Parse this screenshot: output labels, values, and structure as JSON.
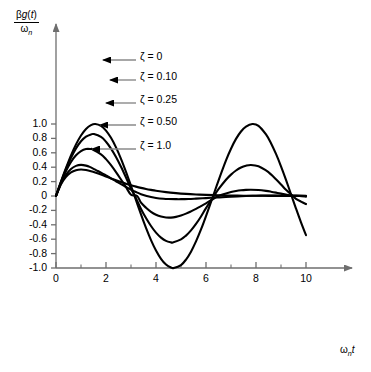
{
  "chart_data": {
    "type": "line",
    "title": "",
    "subtitle": "",
    "xlabel": "ωₙt",
    "ylabel": "βg(t)/ωₙ",
    "ylabel_numerator": "βg(t)",
    "ylabel_denominator": "ωₙ",
    "xlim": [
      0,
      10
    ],
    "ylim": [
      -1.0,
      1.0
    ],
    "grid": false,
    "legend_position": "inside-upper-right",
    "x_ticks_major": [
      0,
      2,
      4,
      6,
      8,
      10
    ],
    "x_tick_labels": [
      "0",
      "2",
      "4",
      "6",
      "8",
      "10"
    ],
    "x_ticks_minor": [
      1,
      3,
      5,
      7,
      9
    ],
    "y_ticks_major": [
      1.0,
      0.8,
      0.6,
      0.4,
      0.2,
      0,
      -0.2,
      -0.4,
      -0.6,
      -0.8,
      -1.0
    ],
    "y_tick_labels": [
      "1.0",
      "0.8",
      "0.6",
      "0.4",
      "0.2",
      "0",
      "-0.2",
      "-0.4",
      "-0.6",
      "-0.8",
      "-1.0"
    ],
    "line_color": "#000000",
    "leader_color": "#8a8a8a",
    "axis_color": "#6e6e6e",
    "series": [
      {
        "name": "ζ = 0",
        "zeta": 0,
        "legend_label": "ζ = 0",
        "peak1": 1.0,
        "peak1_x": 1.57,
        "trough1": -1.0,
        "trough1_x": 4.71,
        "peak2": 0.98,
        "peak2_x": 7.85,
        "end_value": -0.2,
        "x": [
          0,
          0.2,
          0.4,
          0.6,
          0.8,
          1.0,
          1.2,
          1.4,
          1.571,
          1.8,
          2.0,
          2.2,
          2.4,
          2.6,
          2.8,
          3.0,
          3.1416,
          3.4,
          3.6,
          3.8,
          4.0,
          4.2,
          4.4,
          4.6,
          4.712,
          5.0,
          5.2,
          5.4,
          5.6,
          5.8,
          6.0,
          6.2832,
          6.5,
          6.8,
          7.0,
          7.2,
          7.4,
          7.6,
          7.854,
          8.1,
          8.4,
          8.6,
          8.8,
          9.0,
          9.2,
          9.4248,
          9.6,
          9.8,
          10.0
        ],
        "y": [
          0,
          0.199,
          0.389,
          0.565,
          0.717,
          0.841,
          0.932,
          0.985,
          1.0,
          0.974,
          0.909,
          0.808,
          0.675,
          0.516,
          0.335,
          0.141,
          0.0,
          -0.256,
          -0.443,
          -0.612,
          -0.757,
          -0.872,
          -0.952,
          -0.994,
          -1.0,
          -0.959,
          -0.883,
          -0.773,
          -0.631,
          -0.465,
          -0.279,
          0.0,
          0.215,
          0.495,
          0.657,
          0.793,
          0.896,
          0.964,
          1.0,
          0.975,
          0.855,
          0.734,
          0.584,
          0.412,
          0.224,
          0.0,
          -0.174,
          -0.366,
          -0.544
        ]
      },
      {
        "name": "ζ = 0.10",
        "zeta": 0.1,
        "legend_label": "ζ = 0.10",
        "peak1": 0.88,
        "peak1_x": 1.52,
        "trough1": -0.65,
        "trough1_x": 4.67,
        "peak2": 0.44,
        "peak2_x": 7.8,
        "end_value": -0.08,
        "x": [
          0,
          0.2,
          0.4,
          0.6,
          0.8,
          1.0,
          1.2,
          1.4,
          1.52,
          1.8,
          2.0,
          2.2,
          2.4,
          2.6,
          2.8,
          3.0,
          3.157,
          3.4,
          3.6,
          3.8,
          4.0,
          4.2,
          4.4,
          4.6,
          4.67,
          5.0,
          5.2,
          5.4,
          5.6,
          5.8,
          6.0,
          6.315,
          6.5,
          6.8,
          7.0,
          7.2,
          7.4,
          7.6,
          7.8,
          8.1,
          8.4,
          8.6,
          8.8,
          9.0,
          9.2,
          9.472,
          9.6,
          9.8,
          10.0
        ],
        "y": [
          0,
          0.195,
          0.373,
          0.531,
          0.661,
          0.76,
          0.824,
          0.855,
          0.86,
          0.82,
          0.753,
          0.659,
          0.542,
          0.406,
          0.257,
          0.101,
          0.0,
          -0.18,
          -0.306,
          -0.417,
          -0.509,
          -0.578,
          -0.623,
          -0.644,
          -0.645,
          -0.602,
          -0.55,
          -0.478,
          -0.388,
          -0.284,
          -0.169,
          0.0,
          0.095,
          0.226,
          0.297,
          0.354,
          0.396,
          0.421,
          0.431,
          0.414,
          0.355,
          0.3,
          0.233,
          0.161,
          0.086,
          0.0,
          -0.039,
          -0.078,
          -0.112
        ]
      },
      {
        "name": "ζ = 0.25",
        "zeta": 0.25,
        "legend_label": "ζ = 0.25",
        "peak1": 0.72,
        "peak1_x": 1.45,
        "trough1": -0.33,
        "trough1_x": 4.6,
        "peak2": 0.1,
        "peak2_x": 7.7,
        "end_value": -0.02,
        "x": [
          0,
          0.2,
          0.4,
          0.6,
          0.8,
          1.0,
          1.2,
          1.4,
          1.45,
          1.8,
          2.0,
          2.2,
          2.4,
          2.6,
          2.8,
          3.0,
          3.245,
          3.4,
          3.6,
          3.8,
          4.0,
          4.2,
          4.4,
          4.6,
          4.8,
          5.0,
          5.2,
          5.4,
          5.6,
          5.8,
          6.0,
          6.489,
          6.8,
          7.0,
          7.2,
          7.4,
          7.6,
          7.8,
          8.1,
          8.4,
          8.6,
          8.8,
          9.0,
          9.4,
          9.734,
          10.0
        ],
        "y": [
          0,
          0.189,
          0.347,
          0.473,
          0.565,
          0.624,
          0.652,
          0.652,
          0.65,
          0.579,
          0.512,
          0.428,
          0.332,
          0.229,
          0.123,
          0.018,
          0.0,
          -0.093,
          -0.163,
          -0.219,
          -0.26,
          -0.286,
          -0.299,
          -0.3,
          -0.29,
          -0.271,
          -0.245,
          -0.213,
          -0.178,
          -0.14,
          -0.102,
          0.0,
          0.036,
          0.055,
          0.069,
          0.079,
          0.085,
          0.087,
          0.083,
          0.071,
          0.06,
          0.047,
          0.033,
          0.006,
          0.0,
          -0.009
        ]
      },
      {
        "name": "ζ = 0.50",
        "zeta": 0.5,
        "legend_label": "ζ = 0.50",
        "peak1": 0.57,
        "peak1_x": 1.35,
        "trough1": -0.13,
        "trough1_x": 4.5,
        "peak2": 0.03,
        "peak2_x": 7.5,
        "end_value": -0.005,
        "x": [
          0,
          0.2,
          0.4,
          0.6,
          0.8,
          1.0,
          1.2,
          1.35,
          1.6,
          1.8,
          2.0,
          2.2,
          2.4,
          2.6,
          2.8,
          3.0,
          3.2,
          3.4,
          3.628,
          3.8,
          4.0,
          4.3,
          4.5,
          4.8,
          5.0,
          5.3,
          5.6,
          6.0,
          6.4,
          6.8,
          7.255,
          7.6,
          8.0,
          8.4,
          8.8,
          9.2,
          9.6,
          10.0
        ],
        "y": [
          0,
          0.172,
          0.295,
          0.375,
          0.418,
          0.432,
          0.422,
          0.404,
          0.36,
          0.325,
          0.286,
          0.246,
          0.205,
          0.164,
          0.125,
          0.088,
          0.055,
          0.025,
          0.0,
          -0.015,
          -0.027,
          -0.038,
          -0.042,
          -0.044,
          -0.044,
          -0.041,
          -0.036,
          -0.029,
          -0.021,
          -0.014,
          -0.005,
          0.0,
          0.004,
          0.006,
          0.007,
          0.006,
          0.005,
          0.004
        ]
      },
      {
        "name": "ζ = 1.0",
        "zeta": 1.0,
        "legend_label": "ζ = 1.0",
        "peak1": 0.37,
        "peak1_x": 1.0,
        "trough1": -0.03,
        "trough1_x": 4.5,
        "peak2": 0.0,
        "peak2_x": 0,
        "end_value": 0.0,
        "x": [
          0,
          0.2,
          0.4,
          0.6,
          0.8,
          1.0,
          1.2,
          1.4,
          1.6,
          1.8,
          2.0,
          2.2,
          2.4,
          2.6,
          2.8,
          3.0,
          3.2,
          3.4,
          3.6,
          3.8,
          4.0,
          4.4,
          4.8,
          5.2,
          5.6,
          6.0,
          6.5,
          7.0,
          7.5,
          8.0,
          8.5,
          9.0,
          9.5,
          10.0
        ],
        "y": [
          0,
          0.164,
          0.268,
          0.329,
          0.359,
          0.368,
          0.361,
          0.345,
          0.323,
          0.298,
          0.271,
          0.244,
          0.218,
          0.193,
          0.17,
          0.149,
          0.13,
          0.113,
          0.098,
          0.085,
          0.073,
          0.054,
          0.04,
          0.029,
          0.021,
          0.015,
          0.01,
          0.006,
          0.004,
          0.003,
          0.002,
          0.001,
          0.001,
          0.0
        ]
      }
    ],
    "annotations": [
      {
        "label": "ζ = 0",
        "text_x": 140,
        "text_y": 56,
        "leader_from_x": 136,
        "leader_to_x": 103,
        "leader_y": 60
      },
      {
        "label": "ζ = 0.10",
        "text_x": 140,
        "text_y": 76,
        "leader_from_x": 136,
        "leader_to_x": 110,
        "leader_y": 80
      },
      {
        "label": "ζ = 0.25",
        "text_x": 140,
        "text_y": 99,
        "leader_from_x": 136,
        "leader_to_x": 106,
        "leader_y": 103
      },
      {
        "label": "ζ = 0.50",
        "text_x": 140,
        "text_y": 121,
        "leader_from_x": 136,
        "leader_to_x": 100,
        "leader_y": 125
      },
      {
        "label": "ζ = 1.0",
        "text_x": 140,
        "text_y": 145,
        "leader_from_x": 136,
        "leader_to_x": 92,
        "leader_y": 149
      }
    ]
  }
}
